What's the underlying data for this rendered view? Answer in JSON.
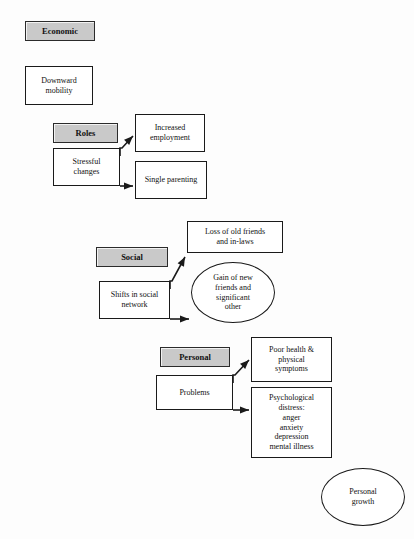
{
  "diagram": {
    "background_color": "#fdfdfd",
    "header_fill": "#c9c9c9",
    "box_fill": "#ffffff",
    "stroke_color": "#1a1a1a",
    "nodes": [
      {
        "id": "economic",
        "kind": "header",
        "label": "Economic",
        "x": 25,
        "y": 21,
        "w": 70,
        "h": 20,
        "font_size": 8.5
      },
      {
        "id": "downward-mobility",
        "kind": "box",
        "label": "Downward\nmobility",
        "x": 25,
        "y": 66,
        "w": 68,
        "h": 39,
        "font_size": 8
      },
      {
        "id": "roles",
        "kind": "header",
        "label": "Roles",
        "x": 53,
        "y": 123,
        "w": 65,
        "h": 20,
        "font_size": 8.5
      },
      {
        "id": "stressful-changes",
        "kind": "box",
        "label": "Stressful\nchanges",
        "x": 53,
        "y": 148,
        "w": 67,
        "h": 38,
        "font_size": 8
      },
      {
        "id": "increased-employment",
        "kind": "box",
        "label": "Increased\nemployment",
        "x": 135,
        "y": 114,
        "w": 70,
        "h": 38,
        "font_size": 8
      },
      {
        "id": "single-parenting",
        "kind": "box",
        "label": "Single parenting",
        "x": 135,
        "y": 161,
        "w": 72,
        "h": 38,
        "font_size": 8
      },
      {
        "id": "social",
        "kind": "header",
        "label": "Social",
        "x": 96,
        "y": 247,
        "w": 72,
        "h": 20,
        "font_size": 8.5
      },
      {
        "id": "shifts-in-social-network",
        "kind": "box",
        "label": "Shifts in social\nnetwork",
        "x": 99,
        "y": 281,
        "w": 71,
        "h": 38,
        "font_size": 8
      },
      {
        "id": "loss-of-old-friends",
        "kind": "box",
        "label": "Loss of old friends\nand in-laws",
        "x": 187,
        "y": 221,
        "w": 96,
        "h": 32,
        "font_size": 8
      },
      {
        "id": "gain-of-new-friends",
        "kind": "ellipse",
        "label": "Gain of new\nfriends and\nsignificant\nother",
        "x": 191,
        "y": 262,
        "w": 84,
        "h": 61,
        "font_size": 8
      },
      {
        "id": "personal",
        "kind": "header",
        "label": "Personal",
        "x": 160,
        "y": 347,
        "w": 70,
        "h": 20,
        "font_size": 8.5
      },
      {
        "id": "problems",
        "kind": "box",
        "label": "Problems",
        "x": 156,
        "y": 375,
        "w": 77,
        "h": 35,
        "font_size": 8
      },
      {
        "id": "poor-health",
        "kind": "box",
        "label": "Poor health &\nphysical\nsymptoms",
        "x": 251,
        "y": 337,
        "w": 81,
        "h": 45,
        "font_size": 8
      },
      {
        "id": "psychological-distress",
        "kind": "box",
        "label": "Psychological\ndistress:\nanger\nanxiety\ndepression\nmental illness",
        "x": 251,
        "y": 387,
        "w": 81,
        "h": 71,
        "font_size": 8
      },
      {
        "id": "personal-growth",
        "kind": "ellipse",
        "label": "Personal\ngrowth",
        "x": 321,
        "y": 468,
        "w": 84,
        "h": 58,
        "font_size": 8
      }
    ],
    "connectors": [
      {
        "id": "stressful-to-employment",
        "from": "stressful-changes",
        "to": "increased-employment",
        "path": "M 120 156 L 120 148 L 122 148 L 133 136",
        "arrow_at": [
          133,
          136
        ],
        "arrow_angle": -45
      },
      {
        "id": "stressful-to-single-parenting",
        "from": "stressful-changes",
        "to": "single-parenting",
        "path": "M 120 186 L 133 186",
        "arrow_at": [
          133,
          186
        ],
        "arrow_angle": 0
      },
      {
        "id": "shifts-to-loss-of-friends",
        "from": "shifts-in-social-network",
        "to": "loss-of-old-friends",
        "path": "M 170 289 L 170 281 L 172 281 L 185 257",
        "arrow_at": [
          185,
          257
        ],
        "arrow_angle": -62
      },
      {
        "id": "shifts-to-gain-of-friends",
        "from": "shifts-in-social-network",
        "to": "gain-of-new-friends",
        "path": "M 170 319 L 189 319",
        "arrow_at": [
          189,
          319
        ],
        "arrow_angle": 0
      },
      {
        "id": "problems-to-poor-health",
        "from": "problems",
        "to": "poor-health",
        "path": "M 233 383 L 233 375 L 235 375 L 249 360",
        "arrow_at": [
          249,
          360
        ],
        "arrow_angle": -45
      },
      {
        "id": "problems-to-psychological-distress",
        "from": "problems",
        "to": "psychological-distress",
        "path": "M 233 410 L 249 410",
        "arrow_at": [
          249,
          410
        ],
        "arrow_angle": 0
      }
    ]
  }
}
